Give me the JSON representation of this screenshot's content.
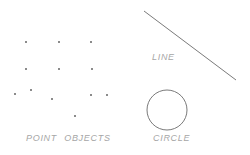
{
  "canvas": {
    "width": 250,
    "height": 155,
    "background_color": "#ffffff"
  },
  "colors": {
    "point_color": "#4c4c4c",
    "stroke_color": "#7a7a7a",
    "label_color": "#a6a6a6"
  },
  "labels": {
    "points_label": "POINT OBJECTS",
    "line_label": "LINE",
    "circle_label": "CIRCLE"
  },
  "diagram": {
    "point_objects": [
      {
        "x": 26,
        "y": 42
      },
      {
        "x": 59,
        "y": 42
      },
      {
        "x": 91,
        "y": 42
      },
      {
        "x": 26,
        "y": 69
      },
      {
        "x": 59,
        "y": 69
      },
      {
        "x": 92,
        "y": 69
      },
      {
        "x": 15,
        "y": 94
      },
      {
        "x": 31,
        "y": 90
      },
      {
        "x": 52,
        "y": 99
      },
      {
        "x": 91,
        "y": 95
      },
      {
        "x": 107,
        "y": 95
      },
      {
        "x": 75,
        "y": 116
      }
    ],
    "line": {
      "x1": 144,
      "y1": 11,
      "x2": 236,
      "y2": 80
    },
    "circle": {
      "cx": 167,
      "cy": 110,
      "r": 20
    }
  }
}
